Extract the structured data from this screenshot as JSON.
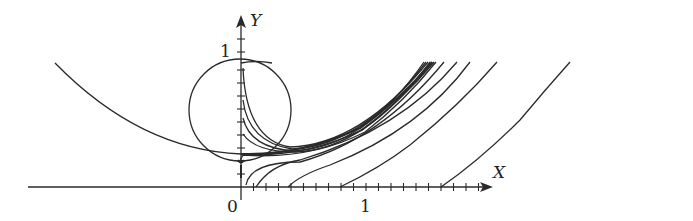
{
  "figure": {
    "type": "phase-curves-diagram",
    "x_axis": {
      "label": "X",
      "origin_label": "0",
      "unit_label": "1",
      "tick_step": 0.1
    },
    "y_axis": {
      "label": "Y",
      "unit_label": "1",
      "tick_step": 0.1
    },
    "elements": [
      "circle tangent to curves near y-axis",
      "large parabolic curve from upper left to y-axis",
      "family of curves emanating from y-axis converging to bundle at upper right",
      "parallel curves starting on x-axis rising to upper right"
    ],
    "colors": {
      "stroke": "#2a2a2a",
      "background": "#ffffff"
    }
  }
}
